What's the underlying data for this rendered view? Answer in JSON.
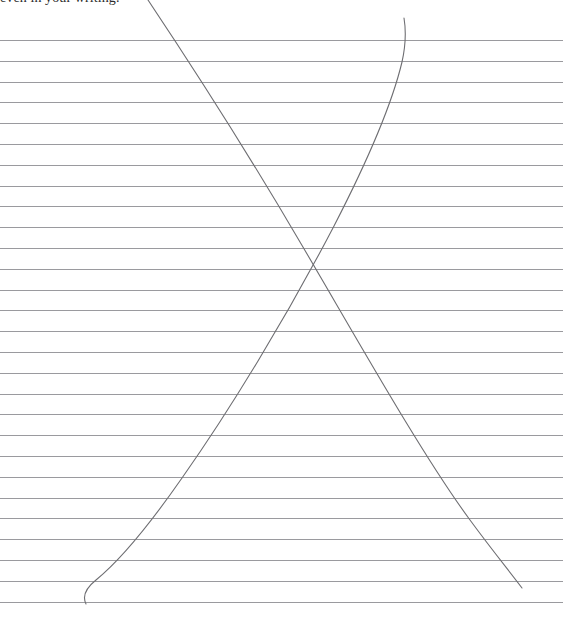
{
  "page": {
    "width": 563,
    "height": 621,
    "background_color": "#ffffff",
    "kind": "scanned-ruled-notebook-page"
  },
  "header": {
    "text": "even in your writing.",
    "clipped": "top of glyphs cut off by page edge",
    "color": "#2b2b2b",
    "left": 0,
    "top": -10
  },
  "ruling": {
    "line_color": "#9a9a9e",
    "line_thickness_px": 1,
    "first_line_y": 40,
    "spacing_px": 20.8,
    "line_count": 28,
    "x_start": 0,
    "x_end": 563
  },
  "ink": {
    "color": "#6e6e72",
    "stroke_width": 1.1,
    "strokes": [
      {
        "name": "descending-stroke",
        "description": "long pen stroke from upper-left of header area down to lower-right, slight curve",
        "start": [
          148,
          0
        ],
        "end": [
          522,
          588
        ],
        "path": "M 148 0 C 200 78 252 160 300 242 C 352 330 420 452 470 520 C 492 550 510 572 522 588"
      },
      {
        "name": "ascending-stroke",
        "description": "long pen stroke rising from lower-left hook up to a curved terminal at upper-right",
        "start": [
          86,
          604
        ],
        "end": [
          404,
          18
        ],
        "path": "M 86 604 C 82 596 86 588 96 580 C 118 562 150 524 182 478 C 230 410 286 318 334 226 C 368 160 392 104 402 62 C 406 44 406 30 404 18"
      }
    ]
  },
  "chart_data": {
    "type": "line",
    "title": "",
    "xlabel": "",
    "ylabel": "",
    "series": [
      {
        "name": "descending-stroke",
        "x": [
          148,
          300,
          470,
          522
        ],
        "y": [
          0,
          242,
          520,
          588
        ]
      },
      {
        "name": "ascending-stroke",
        "x": [
          86,
          182,
          334,
          404
        ],
        "y": [
          604,
          478,
          226,
          18
        ]
      }
    ],
    "annotations": [
      "even in your writing."
    ],
    "grid": true,
    "legend": "none"
  }
}
